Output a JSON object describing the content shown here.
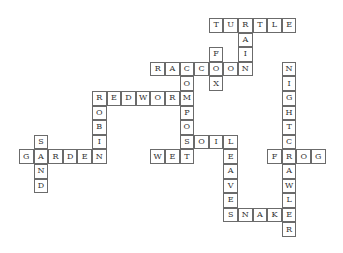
{
  "puzzle": {
    "type": "crossword-solution",
    "cell_size": 14.6,
    "origin": {
      "x": 19,
      "y": 18
    },
    "words": [
      {
        "word": "TURTLE",
        "dir": "across",
        "col": 13,
        "row": 0
      },
      {
        "word": "RAIN",
        "dir": "down",
        "col": 15,
        "row": 0
      },
      {
        "word": "FOX",
        "dir": "down",
        "col": 13,
        "row": 2
      },
      {
        "word": "RACCOON",
        "dir": "across",
        "col": 9,
        "row": 3
      },
      {
        "word": "COMPOST",
        "dir": "down",
        "col": 11,
        "row": 3
      },
      {
        "word": "NIGHTCRAWLER",
        "dir": "down",
        "col": 18,
        "row": 3
      },
      {
        "word": "REDWORM",
        "dir": "across",
        "col": 5,
        "row": 5
      },
      {
        "word": "ROBIN",
        "dir": "down",
        "col": 5,
        "row": 5
      },
      {
        "word": "SOIL",
        "dir": "across",
        "col": 11,
        "row": 8
      },
      {
        "word": "LEAVES",
        "dir": "down",
        "col": 14,
        "row": 8
      },
      {
        "word": "SAND",
        "dir": "down",
        "col": 1,
        "row": 8
      },
      {
        "word": "GARDEN",
        "dir": "across",
        "col": 0,
        "row": 9
      },
      {
        "word": "WET",
        "dir": "across",
        "col": 9,
        "row": 9
      },
      {
        "word": "FROG",
        "dir": "across",
        "col": 17,
        "row": 9
      },
      {
        "word": "SNAKE",
        "dir": "across",
        "col": 14,
        "row": 13
      }
    ]
  }
}
